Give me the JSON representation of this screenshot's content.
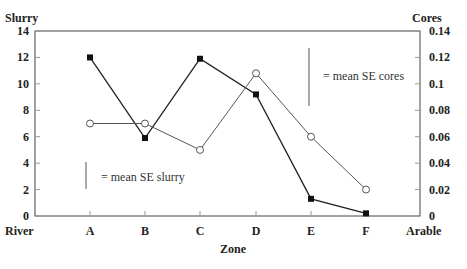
{
  "chart_data": {
    "type": "line",
    "title": "",
    "xlabel": "Zone",
    "ylabel_left": "Slurry",
    "ylabel_right": "Cores",
    "categories": [
      "A",
      "B",
      "C",
      "D",
      "E",
      "F"
    ],
    "x_end_labels": {
      "left": "River",
      "right": "Arable"
    },
    "ylim_left": [
      0,
      14
    ],
    "ylim_right": [
      0,
      0.14
    ],
    "yticks_left": [
      "0",
      "2",
      "4",
      "6",
      "8",
      "10",
      "12",
      "14"
    ],
    "yticks_right": [
      "0",
      "0.02",
      "0.04",
      "0.06",
      "0.08",
      "0.1",
      "0.12",
      "0.14"
    ],
    "grid": false,
    "series": [
      {
        "name": "Slurry",
        "axis": "left",
        "marker": "filled-square",
        "values": [
          12,
          5.9,
          11.9,
          9.2,
          1.3,
          0.2
        ]
      },
      {
        "name": "Cores",
        "axis": "right",
        "marker": "open-circle",
        "values": [
          0.07,
          0.07,
          0.05,
          0.108,
          0.06,
          0.02
        ]
      }
    ],
    "annotations": [
      {
        "text": "= mean SE slurry",
        "error_bar_height_left_units": 2.2
      },
      {
        "text": "= mean SE cores",
        "error_bar_height_right_units": 0.044
      }
    ]
  },
  "labels": {
    "slurry": "Slurry",
    "cores": "Cores",
    "zone": "Zone",
    "river": "River",
    "arable": "Arable",
    "se_slurry": "= mean SE slurry",
    "se_cores": "= mean SE cores"
  }
}
